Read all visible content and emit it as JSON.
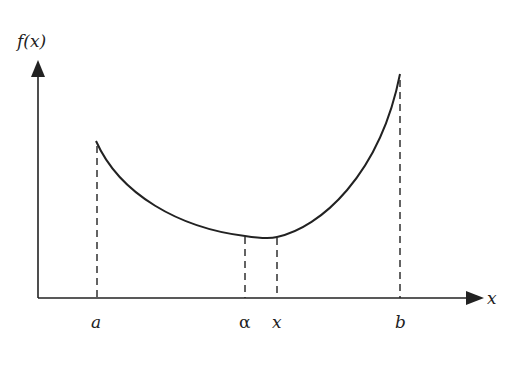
{
  "diagram": {
    "y_axis_label": "f(x)",
    "x_axis_label": "x",
    "x_ticks": [
      {
        "label": "a",
        "x": 97
      },
      {
        "label": "α",
        "x": 245
      },
      {
        "label": "x",
        "x": 277
      },
      {
        "label": "b",
        "x": 400
      }
    ],
    "curve": {
      "description": "convex curve f(x) on [a,b] with minimum near α",
      "start": {
        "x": 96,
        "y": 141
      },
      "min": {
        "x": 265,
        "y": 238
      },
      "end": {
        "x": 400,
        "y": 74
      }
    },
    "colors": {
      "line": "#222222",
      "background": "#ffffff"
    }
  }
}
